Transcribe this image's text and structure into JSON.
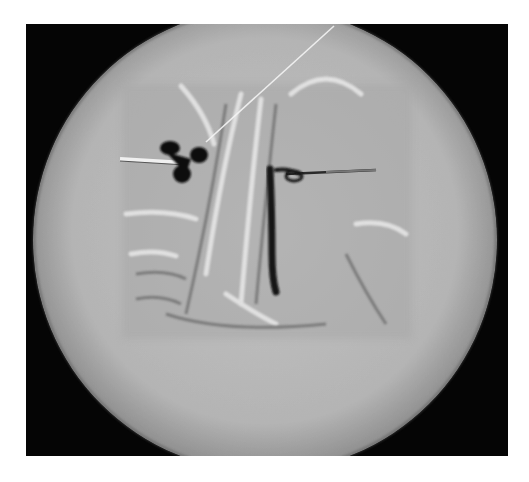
{
  "image": {
    "kind": "fluoroscopic angiography (digital subtraction) image",
    "description": "Circular grayscale fluoroscopy field on black background showing a rectangular subtracted region with vascular structures, two needles with dark contrast accumulation, and a diagonal guidewire",
    "colors": {
      "background": "#050505",
      "field": "#b8b8b8",
      "field_edge": "#9a9a9a",
      "subtracted_region": "#a9a9a9",
      "contrast": "#111111",
      "bright_structure": "#e8e8e8"
    }
  },
  "elements": {
    "left_needle": "needle entering from left with dark contrast blob",
    "right_needle": "needle entering from right with contrast-filled vessel",
    "guidewire": "thin bright diagonal guidewire from top right",
    "vessels": "curved vascular structures in central region"
  }
}
